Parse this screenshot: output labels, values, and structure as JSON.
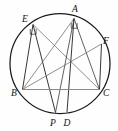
{
  "figure": {
    "type": "geometry-diagram",
    "canvas": {
      "width": 118,
      "height": 131,
      "background": "#fefefe"
    },
    "circle": {
      "cx": 60,
      "cy": 63.5,
      "r": 50,
      "stroke": "#1a1a1a"
    },
    "vertices": [
      {
        "id": "E",
        "label": "E",
        "x": 33.0,
        "y": 24.5,
        "label_x": 22.0,
        "label_y": 21.5
      },
      {
        "id": "A",
        "label": "A",
        "x": 74.0,
        "y": 18.5,
        "label_x": 72.0,
        "label_y": 12.0
      },
      {
        "id": "F",
        "label": "F",
        "x": 101.5,
        "y": 44.0,
        "label_x": 103.0,
        "label_y": 43.5
      },
      {
        "id": "B",
        "label": "B",
        "x": 22.5,
        "y": 89.5,
        "label_x": 11.0,
        "label_y": 96.0
      },
      {
        "id": "C",
        "label": "C",
        "x": 99.5,
        "y": 89.5,
        "label_x": 103.0,
        "label_y": 96.0
      },
      {
        "id": "P",
        "label": "P",
        "x": 55.5,
        "y": 112.5,
        "label_x": 50.0,
        "label_y": 126.0
      },
      {
        "id": "D",
        "label": "D",
        "x": 67.0,
        "y": 112.0,
        "label_x": 63.5,
        "label_y": 126.0
      }
    ],
    "segments": [
      {
        "name": "segment-EB",
        "from": "E",
        "to": "B",
        "style": "chord-strong"
      },
      {
        "name": "segment-EP",
        "from": "E",
        "to": "P",
        "style": "chord-strong"
      },
      {
        "name": "segment-EC",
        "from": "E",
        "to": "C",
        "style": "chord-light"
      },
      {
        "name": "segment-AB",
        "from": "A",
        "to": "B",
        "style": "chord-light"
      },
      {
        "name": "segment-AP",
        "from": "A",
        "to": "P",
        "style": "chord"
      },
      {
        "name": "segment-AD",
        "from": "A",
        "to": "D",
        "style": "chord-strong"
      },
      {
        "name": "segment-AC",
        "from": "A",
        "to": "C",
        "style": "chord"
      },
      {
        "name": "segment-BF",
        "from": "B",
        "to": "F",
        "style": "chord-light"
      },
      {
        "name": "segment-FC",
        "from": "F",
        "to": "C",
        "style": "chord-strong"
      },
      {
        "name": "segment-BC",
        "from": "B",
        "to": "C",
        "style": "basechord"
      }
    ],
    "angle_marks": [
      {
        "name": "right-angle-mark-at-E",
        "vertex": "E",
        "type": "right-angle"
      },
      {
        "name": "right-angle-mark-at-A",
        "vertex": "A",
        "type": "right-angle"
      }
    ],
    "labels_note": "Vertex letters are italic serif capitals."
  }
}
